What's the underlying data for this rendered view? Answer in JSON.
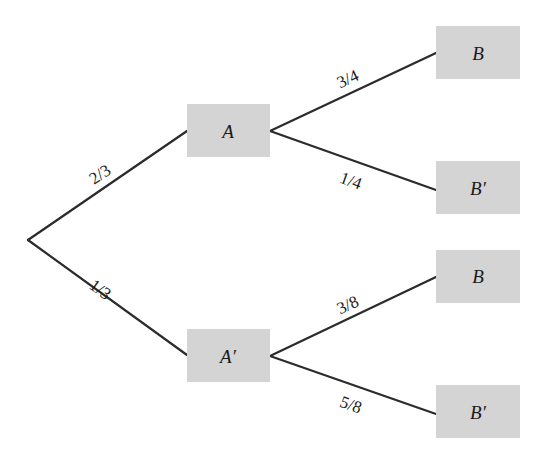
{
  "diagram": {
    "type": "probability-tree",
    "nodes": {
      "A": {
        "label": "A"
      },
      "A_prime": {
        "label": "A′"
      },
      "B_given_A": {
        "label": "B"
      },
      "B_prime_given_A": {
        "label": "B′"
      },
      "B_given_A_prime": {
        "label": "B"
      },
      "B_prime_given_A_prime": {
        "label": "B′"
      }
    },
    "edges": {
      "root_to_A": {
        "probability": "2/3"
      },
      "root_to_A_prime": {
        "probability": "1/3"
      },
      "A_to_B": {
        "probability": "3/4"
      },
      "A_to_B_prime": {
        "probability": "1/4"
      },
      "A_prime_to_B": {
        "probability": "3/8"
      },
      "A_prime_to_B_prime": {
        "probability": "5/8"
      }
    },
    "colors": {
      "box_fill": "#d4d4d4",
      "line": "#2b2b2b",
      "text": "#1a1a1a"
    }
  }
}
